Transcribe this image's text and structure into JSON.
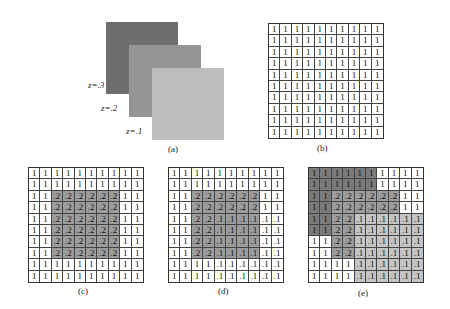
{
  "panel_a": {
    "caption": "(a)",
    "layers": [
      {
        "label": "z=.3",
        "color": "#6e6e6e"
      },
      {
        "label": "z=.2",
        "color": "#959595"
      },
      {
        "label": "z=.1",
        "color": "#bdbdbd"
      }
    ]
  },
  "shade_colors": {
    "white": "#ffffff",
    "dark": "#7a7a7a",
    "medium": "#9c9c9c",
    "light": "#c4c4c4"
  },
  "grids": [
    {
      "id": "b",
      "caption": "(b)",
      "values": [
        [
          "1",
          "1",
          "1",
          "1",
          "1",
          "1",
          "1",
          "1",
          "1",
          "1"
        ],
        [
          "1",
          "1",
          "1",
          "1",
          "1",
          "1",
          "1",
          "1",
          "1",
          "1"
        ],
        [
          "1",
          "1",
          "1",
          "1",
          "1",
          "1",
          "1",
          "1",
          "1",
          "1"
        ],
        [
          "1",
          "1",
          "1",
          "1",
          "1",
          "1",
          "1",
          "1",
          "1",
          "1"
        ],
        [
          "1",
          "1",
          "1",
          "1",
          "1",
          "1",
          "1",
          "1",
          "1",
          "1"
        ],
        [
          "1",
          "1",
          "1",
          "1",
          "1",
          "1",
          "1",
          "1",
          "1",
          "1"
        ],
        [
          "1",
          "1",
          "1",
          "1",
          "1",
          "1",
          "1",
          "1",
          "1",
          "1"
        ],
        [
          "1",
          "1",
          "1",
          "1",
          "1",
          "1",
          "1",
          "1",
          "1",
          "1"
        ],
        [
          "1",
          "1",
          "1",
          "1",
          "1",
          "1",
          "1",
          "1",
          "1",
          "1"
        ],
        [
          "1",
          "1",
          "1",
          "1",
          "1",
          "1",
          "1",
          "1",
          "1",
          "1"
        ]
      ],
      "shades": [
        "wwwwwwwwww",
        "wwwwwwwwww",
        "wwwwwwwwww",
        "wwwwwwwwww",
        "wwwwwwwwww",
        "wwwwwwwwww",
        "wwwwwwwwww",
        "wwwwwwwwww",
        "wwwwwwwwww",
        "wwwwwwwwww"
      ]
    },
    {
      "id": "c",
      "caption": "(c)",
      "values": [
        [
          "1",
          "1",
          "1",
          "1",
          "1",
          "1",
          "1",
          "1",
          "1",
          "1"
        ],
        [
          "1",
          "1",
          "1",
          "1",
          "1",
          "1",
          "1",
          "1",
          "1",
          "1"
        ],
        [
          "1",
          "1",
          ".2",
          ".2",
          ".2",
          ".2",
          ".2",
          ".2",
          "1",
          "1"
        ],
        [
          "1",
          "1",
          ".2",
          ".2",
          ".2",
          ".2",
          ".2",
          ".2",
          "1",
          "1"
        ],
        [
          "1",
          "1",
          ".2",
          ".2",
          ".2",
          ".2",
          ".2",
          ".2",
          "1",
          "1"
        ],
        [
          "1",
          "1",
          ".2",
          ".2",
          ".2",
          ".2",
          ".2",
          ".2",
          "1",
          "1"
        ],
        [
          "1",
          "1",
          ".2",
          ".2",
          ".2",
          ".2",
          ".2",
          ".2",
          "1",
          "1"
        ],
        [
          "1",
          "1",
          ".2",
          ".2",
          ".2",
          ".2",
          ".2",
          ".2",
          "1",
          "1"
        ],
        [
          "1",
          "1",
          "1",
          "1",
          "1",
          "1",
          "1",
          "1",
          "1",
          "1"
        ],
        [
          "1",
          "1",
          "1",
          "1",
          "1",
          "1",
          "1",
          "1",
          "1",
          "1"
        ]
      ],
      "shades": [
        "wwwwwwwwww",
        "wwwwwwwwww",
        "wwmmmmmmww",
        "wwmmmmmmww",
        "wwmmmmmmww",
        "wwmmmmmmww",
        "wwmmmmmmww",
        "wwmmmmmmww",
        "wwwwwwwwww",
        "wwwwwwwwww"
      ]
    },
    {
      "id": "d",
      "caption": "(d)",
      "values": [
        [
          "1",
          "1",
          "1",
          "1",
          "1",
          "1",
          "1",
          "1",
          "1",
          "1"
        ],
        [
          "1",
          "1",
          "1",
          "1",
          "1",
          "1",
          "1",
          "1",
          "1",
          "1"
        ],
        [
          "1",
          "1",
          ".2",
          ".2",
          ".2",
          ".2",
          ".2",
          ".2",
          "1",
          "1"
        ],
        [
          "1",
          "1",
          ".2",
          ".2",
          ".2",
          ".2",
          ".2",
          ".2",
          "1",
          "1"
        ],
        [
          "1",
          "1",
          ".2",
          ".2",
          ".1",
          ".1",
          ".1",
          ".1",
          ".1",
          ".1"
        ],
        [
          "1",
          "1",
          ".2",
          ".2",
          ".1",
          ".1",
          ".1",
          ".1",
          ".1",
          ".1"
        ],
        [
          "1",
          "1",
          ".2",
          ".2",
          ".1",
          ".1",
          ".1",
          ".1",
          ".1",
          ".1"
        ],
        [
          "1",
          "1",
          ".2",
          ".2",
          ".1",
          ".1",
          ".1",
          ".1",
          ".1",
          ".1"
        ],
        [
          "1",
          "1",
          "1",
          "1",
          ".1",
          ".1",
          ".1",
          ".1",
          ".1",
          ".1"
        ],
        [
          "1",
          "1",
          "1",
          "1",
          ".1",
          ".1",
          ".1",
          ".1",
          ".1",
          ".1"
        ]
      ],
      "shades": [
        "wwwwwwwwww",
        "wwwwwwwwww",
        "wwmmmmmmww",
        "wwmmmmmmww",
        "wwmmmmmmww",
        "wwmmmmmmww",
        "wwmmmmmmww",
        "wwmmmmmmww",
        "wwwwwwwwww",
        "wwwwwwwwww"
      ]
    },
    {
      "id": "e",
      "caption": "(e)",
      "values": [
        [
          "1",
          "1",
          "1",
          "1",
          "1",
          "1",
          "1",
          "1",
          "1",
          "1"
        ],
        [
          "1",
          "1",
          "1",
          "1",
          "1",
          "1",
          "1",
          "1",
          "1",
          "1"
        ],
        [
          "1",
          "1",
          ".2",
          ".2",
          ".2",
          ".2",
          ".2",
          ".2",
          "1",
          "1"
        ],
        [
          "1",
          "1",
          ".2",
          ".2",
          ".2",
          ".2",
          ".2",
          ".2",
          "1",
          "1"
        ],
        [
          "1",
          "1",
          ".2",
          ".2",
          ".1",
          ".1",
          ".1",
          ".1",
          ".1",
          ".1"
        ],
        [
          "1",
          "1",
          ".2",
          ".2",
          ".1",
          ".1",
          ".1",
          ".1",
          ".1",
          ".1"
        ],
        [
          "1",
          "1",
          ".2",
          ".2",
          ".1",
          ".1",
          ".1",
          ".1",
          ".1",
          ".1"
        ],
        [
          "1",
          "1",
          ".2",
          ".2",
          ".1",
          ".1",
          ".1",
          ".1",
          ".1",
          ".1"
        ],
        [
          "1",
          "1",
          "1",
          "1",
          ".1",
          ".1",
          ".1",
          ".1",
          ".1",
          ".1"
        ],
        [
          "1",
          "1",
          "1",
          "1",
          ".1",
          ".1",
          ".1",
          ".1",
          ".1",
          ".1"
        ]
      ],
      "shades": [
        "ddddddwwww",
        "ddddddwwww",
        "ddmmmmmmww",
        "ddmmmmmmww",
        "ddmmllllll",
        "ddmmllllll",
        "wwmmllllll",
        "wwmmllllll",
        "wwwwllllll",
        "wwwwllllll"
      ]
    }
  ]
}
